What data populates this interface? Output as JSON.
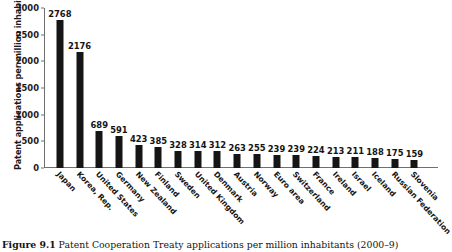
{
  "chart_data": {
    "type": "bar",
    "title": "",
    "xlabel": "",
    "ylabel": "Patent applications per million inhabitants",
    "ylim": [
      0,
      3000
    ],
    "yticks": [
      0,
      500,
      1000,
      1500,
      2000,
      2500,
      3000
    ],
    "grid": false,
    "legend": "none",
    "bar_color": "#151515",
    "categories": [
      "Japan",
      "Korea, Rep.",
      "United States",
      "Germany",
      "New Zealand",
      "Finland",
      "Sweden",
      "United Kingdom",
      "Denmark",
      "Austria",
      "Norway",
      "Euro area",
      "Switzerland",
      "France",
      "Ireland",
      "Israel",
      "Iceland",
      "Russian Federation",
      "Slovenia"
    ],
    "values": [
      2768,
      2176,
      689,
      591,
      423,
      385,
      328,
      314,
      312,
      263,
      255,
      239,
      239,
      224,
      213,
      211,
      188,
      175,
      159
    ]
  },
  "caption": {
    "label": "Figure 9.1",
    "text": "Patent Cooperation Treaty applications per million inhabitants (2000–9)"
  }
}
